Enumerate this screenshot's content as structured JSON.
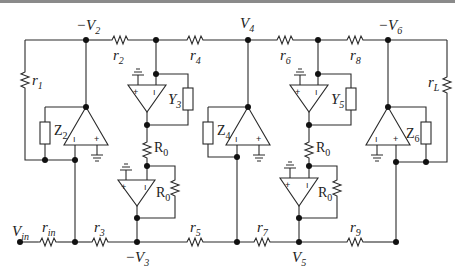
{
  "diagram": {
    "type": "circuit-schematic",
    "nodes": {
      "v2": {
        "label": "−V",
        "sub": "2"
      },
      "v3": {
        "label": "−V",
        "sub": "3"
      },
      "v4": {
        "label": "V",
        "sub": "4"
      },
      "v5": {
        "label": "V",
        "sub": "5"
      },
      "v6": {
        "label": "−V",
        "sub": "6"
      },
      "vin": {
        "label": "V",
        "sub": "in"
      }
    },
    "resistors": {
      "r1": {
        "label": "r",
        "sub": "1"
      },
      "r2": {
        "label": "r",
        "sub": "2"
      },
      "r3": {
        "label": "r",
        "sub": "3"
      },
      "r4": {
        "label": "r",
        "sub": "4"
      },
      "r5": {
        "label": "r",
        "sub": "5"
      },
      "r6": {
        "label": "r",
        "sub": "6"
      },
      "r7": {
        "label": "r",
        "sub": "7"
      },
      "r8": {
        "label": "r",
        "sub": "8"
      },
      "r9": {
        "label": "r",
        "sub": "9"
      },
      "rin": {
        "label": "r",
        "sub": "in"
      },
      "rL": {
        "label": "r",
        "sub": "L"
      },
      "r0a": {
        "label": "R",
        "sub": "0"
      },
      "r0b": {
        "label": "R",
        "sub": "0"
      },
      "r0c": {
        "label": "R",
        "sub": "0"
      },
      "r0d": {
        "label": "R",
        "sub": "0"
      }
    },
    "impedances": {
      "z2": {
        "label": "Z",
        "sub": "2"
      },
      "z4": {
        "label": "Z",
        "sub": "4"
      },
      "z6": {
        "label": "Z",
        "sub": "6"
      },
      "y3": {
        "label": "Y",
        "sub": "3"
      },
      "y5": {
        "label": "Y",
        "sub": "5"
      }
    },
    "opamp_pins": {
      "minus": "−",
      "plus": "+"
    }
  }
}
